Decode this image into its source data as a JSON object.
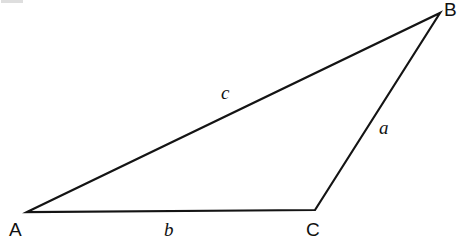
{
  "figure": {
    "kind": "geometry-diagram",
    "shape": "triangle",
    "background_color": "#ffffff",
    "stroke_color": "#141414",
    "stroke_width": 2.2,
    "canvas": {
      "width": 461,
      "height": 247
    }
  },
  "vertices": [
    {
      "name": "A",
      "label": "A",
      "x": 27,
      "y": 212,
      "label_x": 9,
      "label_y": 220
    },
    {
      "name": "B",
      "label": "B",
      "x": 440,
      "y": 13,
      "label_x": 444,
      "label_y": 0
    },
    {
      "name": "C",
      "label": "C",
      "x": 315,
      "y": 210,
      "label_x": 306,
      "label_y": 220
    }
  ],
  "sides": [
    {
      "name": "a",
      "label": "a",
      "from": "B",
      "to": "C",
      "label_x": 379,
      "label_y": 118
    },
    {
      "name": "b",
      "label": "b",
      "from": "A",
      "to": "C",
      "label_x": 164,
      "label_y": 220
    },
    {
      "name": "c",
      "label": "c",
      "from": "A",
      "to": "B",
      "label_x": 221,
      "label_y": 83
    }
  ],
  "artifact": {
    "present": true,
    "color": "#d8d8d8"
  },
  "chart_data": {
    "type": "diagram",
    "title": "",
    "xlabel": "",
    "ylabel": "",
    "points": [
      {
        "label": "A",
        "x": 27,
        "y": 212
      },
      {
        "label": "B",
        "x": 440,
        "y": 13
      },
      {
        "label": "C",
        "x": 315,
        "y": 210
      }
    ],
    "edges": [
      {
        "label": "c",
        "from": [
          27,
          212
        ],
        "to": [
          440,
          13
        ]
      },
      {
        "label": "a",
        "from": [
          440,
          13
        ],
        "to": [
          315,
          210
        ]
      },
      {
        "label": "b",
        "from": [
          315,
          210
        ],
        "to": [
          27,
          212
        ]
      }
    ],
    "annotations": [
      "A",
      "B",
      "C",
      "a",
      "b",
      "c"
    ]
  }
}
